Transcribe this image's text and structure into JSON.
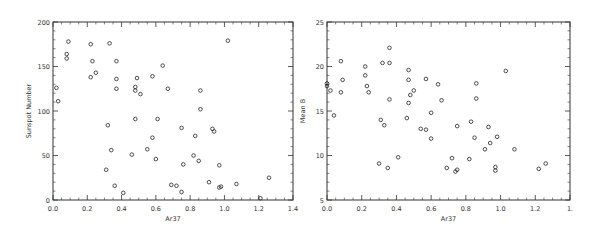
{
  "chart_data": [
    {
      "type": "scatter",
      "title": "",
      "xlabel": "Ar37",
      "ylabel": "Sunspot Number",
      "xlim": [
        0.0,
        1.4
      ],
      "ylim": [
        0,
        200
      ],
      "xticks": [
        "0.0",
        "0.2",
        "0.4",
        "0.6",
        "0.8",
        "1.0",
        "1.2",
        "1.4"
      ],
      "yticks": [
        "0",
        "50",
        "100",
        "150",
        "200"
      ],
      "grid": false,
      "legend": null,
      "marker": "open-circle",
      "points": [
        [
          0.02,
          126
        ],
        [
          0.03,
          111
        ],
        [
          0.08,
          164
        ],
        [
          0.08,
          159
        ],
        [
          0.09,
          178
        ],
        [
          0.22,
          175
        ],
        [
          0.22,
          138
        ],
        [
          0.23,
          156
        ],
        [
          0.25,
          143
        ],
        [
          0.31,
          34
        ],
        [
          0.32,
          84
        ],
        [
          0.33,
          176
        ],
        [
          0.34,
          56
        ],
        [
          0.36,
          16
        ],
        [
          0.37,
          156
        ],
        [
          0.37,
          136
        ],
        [
          0.37,
          125
        ],
        [
          0.41,
          8
        ],
        [
          0.46,
          51
        ],
        [
          0.48,
          127
        ],
        [
          0.48,
          123
        ],
        [
          0.48,
          91
        ],
        [
          0.49,
          137
        ],
        [
          0.51,
          119
        ],
        [
          0.55,
          57
        ],
        [
          0.58,
          139
        ],
        [
          0.58,
          70
        ],
        [
          0.6,
          46
        ],
        [
          0.61,
          91
        ],
        [
          0.64,
          151
        ],
        [
          0.67,
          125
        ],
        [
          0.69,
          17
        ],
        [
          0.72,
          16
        ],
        [
          0.75,
          9
        ],
        [
          0.75,
          81
        ],
        [
          0.76,
          40
        ],
        [
          0.82,
          50
        ],
        [
          0.83,
          72
        ],
        [
          0.85,
          44
        ],
        [
          0.86,
          123
        ],
        [
          0.86,
          102
        ],
        [
          0.91,
          20
        ],
        [
          0.93,
          80
        ],
        [
          0.94,
          77
        ],
        [
          0.97,
          14
        ],
        [
          0.97,
          39
        ],
        [
          0.98,
          15
        ],
        [
          1.02,
          179
        ],
        [
          1.07,
          18
        ],
        [
          1.21,
          2
        ],
        [
          1.26,
          25
        ]
      ]
    },
    {
      "type": "scatter",
      "title": "",
      "xlabel": "Ar37",
      "ylabel": "Mean B",
      "xlim": [
        0.0,
        1.4
      ],
      "ylim": [
        5,
        25
      ],
      "xticks": [
        "0.0",
        "0.2",
        "0.4",
        "0.6",
        "0.8",
        "1.0",
        "1.2",
        "1."
      ],
      "yticks": [
        "5",
        "10",
        "15",
        "20",
        "25"
      ],
      "grid": false,
      "legend": null,
      "marker": "open-circle",
      "points": [
        [
          0.0,
          18.1
        ],
        [
          0.0,
          17.8
        ],
        [
          0.02,
          17.3
        ],
        [
          0.04,
          14.5
        ],
        [
          0.08,
          17.1
        ],
        [
          0.08,
          20.6
        ],
        [
          0.09,
          18.5
        ],
        [
          0.22,
          20.0
        ],
        [
          0.22,
          19.0
        ],
        [
          0.23,
          17.8
        ],
        [
          0.24,
          17.1
        ],
        [
          0.3,
          9.1
        ],
        [
          0.31,
          14.0
        ],
        [
          0.32,
          20.4
        ],
        [
          0.33,
          13.4
        ],
        [
          0.35,
          8.6
        ],
        [
          0.36,
          22.1
        ],
        [
          0.36,
          20.4
        ],
        [
          0.36,
          16.3
        ],
        [
          0.41,
          9.8
        ],
        [
          0.46,
          14.2
        ],
        [
          0.47,
          19.6
        ],
        [
          0.47,
          18.5
        ],
        [
          0.47,
          15.9
        ],
        [
          0.48,
          16.8
        ],
        [
          0.5,
          17.3
        ],
        [
          0.54,
          13.0
        ],
        [
          0.57,
          18.6
        ],
        [
          0.57,
          12.9
        ],
        [
          0.6,
          11.9
        ],
        [
          0.6,
          14.8
        ],
        [
          0.64,
          18.0
        ],
        [
          0.66,
          16.2
        ],
        [
          0.69,
          8.6
        ],
        [
          0.72,
          9.7
        ],
        [
          0.74,
          8.2
        ],
        [
          0.75,
          13.3
        ],
        [
          0.75,
          8.4
        ],
        [
          0.82,
          9.6
        ],
        [
          0.83,
          13.8
        ],
        [
          0.85,
          12.0
        ],
        [
          0.86,
          18.1
        ],
        [
          0.86,
          16.4
        ],
        [
          0.91,
          10.7
        ],
        [
          0.93,
          13.2
        ],
        [
          0.94,
          11.4
        ],
        [
          0.97,
          8.7
        ],
        [
          0.97,
          8.3
        ],
        [
          0.98,
          12.1
        ],
        [
          1.03,
          19.5
        ],
        [
          1.08,
          10.7
        ],
        [
          1.22,
          8.5
        ],
        [
          1.26,
          9.1
        ]
      ]
    }
  ]
}
